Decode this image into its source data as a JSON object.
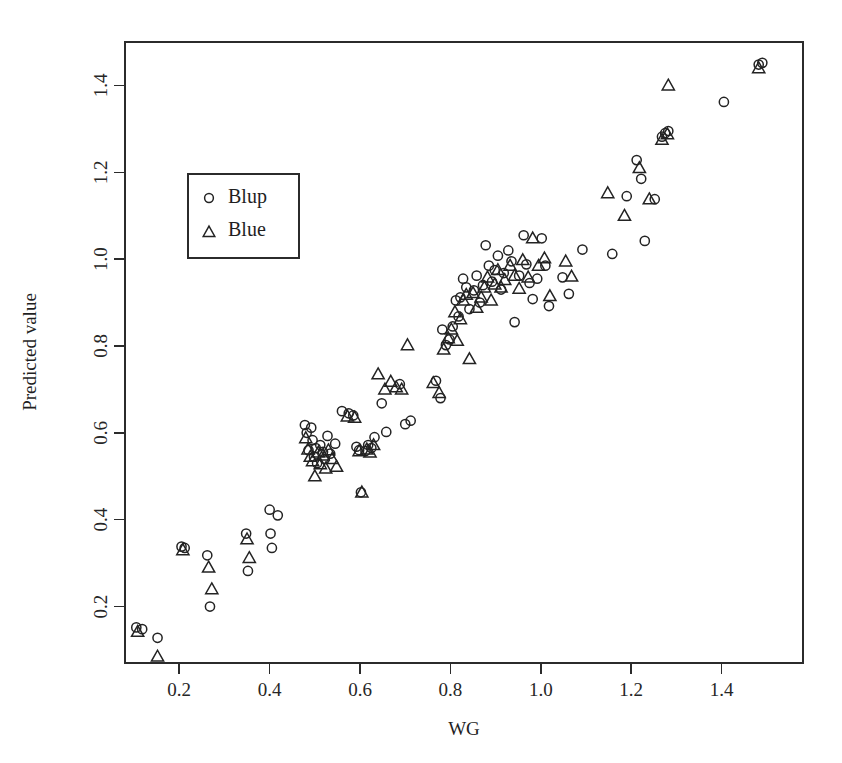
{
  "chart_data": {
    "type": "scatter",
    "title": "",
    "xlabel": "WG",
    "ylabel": "Predicted value",
    "xlim": [
      0.08,
      1.58
    ],
    "ylim": [
      0.07,
      1.5
    ],
    "xticks": [
      0.2,
      0.4,
      0.6,
      0.8,
      1.0,
      1.2,
      1.4
    ],
    "xticklabels": [
      "0.2",
      "0.4",
      "0.6",
      "0.8",
      "1.0",
      "1.2",
      "1.4"
    ],
    "yticks": [
      0.2,
      0.4,
      0.6,
      0.8,
      1.0,
      1.2,
      1.4
    ],
    "yticklabels": [
      "0.2",
      "0.4",
      "0.6",
      "0.8",
      "1.0",
      "1.2",
      "1.4"
    ],
    "grid": false,
    "legend_position": "upper left",
    "series": [
      {
        "name": "Blup",
        "marker": "circle",
        "color": "#232323",
        "points": [
          [
            0.105,
            0.152
          ],
          [
            0.118,
            0.148
          ],
          [
            0.152,
            0.128
          ],
          [
            0.205,
            0.338
          ],
          [
            0.212,
            0.335
          ],
          [
            0.262,
            0.318
          ],
          [
            0.268,
            0.2
          ],
          [
            0.348,
            0.368
          ],
          [
            0.352,
            0.282
          ],
          [
            0.4,
            0.423
          ],
          [
            0.402,
            0.368
          ],
          [
            0.405,
            0.335
          ],
          [
            0.418,
            0.41
          ],
          [
            0.478,
            0.618
          ],
          [
            0.482,
            0.6
          ],
          [
            0.486,
            0.56
          ],
          [
            0.492,
            0.612
          ],
          [
            0.495,
            0.583
          ],
          [
            0.498,
            0.545
          ],
          [
            0.502,
            0.565
          ],
          [
            0.505,
            0.53
          ],
          [
            0.512,
            0.572
          ],
          [
            0.518,
            0.556
          ],
          [
            0.522,
            0.54
          ],
          [
            0.528,
            0.593
          ],
          [
            0.534,
            0.552
          ],
          [
            0.545,
            0.575
          ],
          [
            0.56,
            0.65
          ],
          [
            0.575,
            0.645
          ],
          [
            0.585,
            0.64
          ],
          [
            0.592,
            0.568
          ],
          [
            0.598,
            0.56
          ],
          [
            0.602,
            0.463
          ],
          [
            0.612,
            0.558
          ],
          [
            0.618,
            0.572
          ],
          [
            0.625,
            0.565
          ],
          [
            0.632,
            0.59
          ],
          [
            0.648,
            0.668
          ],
          [
            0.658,
            0.602
          ],
          [
            0.688,
            0.712
          ],
          [
            0.7,
            0.62
          ],
          [
            0.712,
            0.628
          ],
          [
            0.768,
            0.72
          ],
          [
            0.778,
            0.68
          ],
          [
            0.782,
            0.838
          ],
          [
            0.79,
            0.802
          ],
          [
            0.798,
            0.815
          ],
          [
            0.805,
            0.845
          ],
          [
            0.812,
            0.905
          ],
          [
            0.818,
            0.868
          ],
          [
            0.822,
            0.912
          ],
          [
            0.828,
            0.955
          ],
          [
            0.835,
            0.935
          ],
          [
            0.842,
            0.885
          ],
          [
            0.852,
            0.928
          ],
          [
            0.858,
            0.962
          ],
          [
            0.865,
            0.9
          ],
          [
            0.872,
            0.94
          ],
          [
            0.878,
            1.032
          ],
          [
            0.885,
            0.985
          ],
          [
            0.892,
            0.948
          ],
          [
            0.898,
            0.975
          ],
          [
            0.905,
            1.008
          ],
          [
            0.912,
            0.93
          ],
          [
            0.918,
            0.968
          ],
          [
            0.928,
            1.02
          ],
          [
            0.935,
            0.995
          ],
          [
            0.942,
            0.855
          ],
          [
            0.952,
            0.962
          ],
          [
            0.962,
            1.055
          ],
          [
            0.968,
            0.988
          ],
          [
            0.975,
            0.945
          ],
          [
            0.982,
            0.908
          ],
          [
            0.992,
            0.955
          ],
          [
            1.002,
            1.048
          ],
          [
            1.01,
            0.985
          ],
          [
            1.018,
            0.892
          ],
          [
            1.048,
            0.958
          ],
          [
            1.062,
            0.92
          ],
          [
            1.092,
            1.022
          ],
          [
            1.158,
            1.012
          ],
          [
            1.19,
            1.145
          ],
          [
            1.212,
            1.228
          ],
          [
            1.222,
            1.185
          ],
          [
            1.23,
            1.042
          ],
          [
            1.252,
            1.138
          ],
          [
            1.268,
            1.282
          ],
          [
            1.275,
            1.29
          ],
          [
            1.282,
            1.295
          ],
          [
            1.405,
            1.362
          ],
          [
            1.482,
            1.448
          ],
          [
            1.49,
            1.452
          ]
        ]
      },
      {
        "name": "Blue",
        "marker": "triangle",
        "color": "#232323",
        "points": [
          [
            0.108,
            0.142
          ],
          [
            0.152,
            0.085
          ],
          [
            0.208,
            0.33
          ],
          [
            0.265,
            0.29
          ],
          [
            0.272,
            0.24
          ],
          [
            0.35,
            0.355
          ],
          [
            0.355,
            0.312
          ],
          [
            0.48,
            0.588
          ],
          [
            0.485,
            0.562
          ],
          [
            0.49,
            0.545
          ],
          [
            0.495,
            0.535
          ],
          [
            0.5,
            0.5
          ],
          [
            0.508,
            0.555
          ],
          [
            0.512,
            0.528
          ],
          [
            0.518,
            0.548
          ],
          [
            0.524,
            0.518
          ],
          [
            0.53,
            0.56
          ],
          [
            0.538,
            0.54
          ],
          [
            0.548,
            0.522
          ],
          [
            0.572,
            0.638
          ],
          [
            0.588,
            0.635
          ],
          [
            0.598,
            0.558
          ],
          [
            0.604,
            0.463
          ],
          [
            0.615,
            0.562
          ],
          [
            0.622,
            0.555
          ],
          [
            0.63,
            0.572
          ],
          [
            0.64,
            0.735
          ],
          [
            0.655,
            0.7
          ],
          [
            0.668,
            0.718
          ],
          [
            0.68,
            0.705
          ],
          [
            0.692,
            0.7
          ],
          [
            0.705,
            0.802
          ],
          [
            0.762,
            0.715
          ],
          [
            0.775,
            0.692
          ],
          [
            0.785,
            0.792
          ],
          [
            0.795,
            0.818
          ],
          [
            0.802,
            0.838
          ],
          [
            0.81,
            0.878
          ],
          [
            0.815,
            0.812
          ],
          [
            0.822,
            0.862
          ],
          [
            0.828,
            0.905
          ],
          [
            0.835,
            0.918
          ],
          [
            0.842,
            0.77
          ],
          [
            0.85,
            0.922
          ],
          [
            0.858,
            0.888
          ],
          [
            0.868,
            0.912
          ],
          [
            0.875,
            0.935
          ],
          [
            0.882,
            0.958
          ],
          [
            0.89,
            0.905
          ],
          [
            0.898,
            0.942
          ],
          [
            0.905,
            0.975
          ],
          [
            0.912,
            0.935
          ],
          [
            0.92,
            0.952
          ],
          [
            0.932,
            0.985
          ],
          [
            0.942,
            0.962
          ],
          [
            0.952,
            0.932
          ],
          [
            0.96,
            0.998
          ],
          [
            0.972,
            0.958
          ],
          [
            0.982,
            1.048
          ],
          [
            0.995,
            0.985
          ],
          [
            1.008,
            1.002
          ],
          [
            1.02,
            0.915
          ],
          [
            1.055,
            0.995
          ],
          [
            1.068,
            0.96
          ],
          [
            1.148,
            1.152
          ],
          [
            1.185,
            1.1
          ],
          [
            1.218,
            1.21
          ],
          [
            1.24,
            1.138
          ],
          [
            1.268,
            1.275
          ],
          [
            1.28,
            1.288
          ],
          [
            1.282,
            1.4
          ],
          [
            1.482,
            1.44
          ]
        ]
      }
    ]
  },
  "legend": {
    "entries": [
      {
        "label": "Blup",
        "marker": "circle"
      },
      {
        "label": "Blue",
        "marker": "triangle"
      }
    ]
  }
}
